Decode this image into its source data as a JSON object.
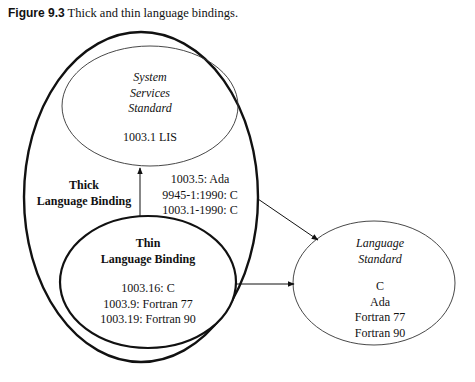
{
  "caption": {
    "label": "Figure 9.3",
    "text": " Thick and thin language bindings."
  },
  "nodes": {
    "system_services": {
      "title_lines": [
        "System",
        "Services",
        "Standard"
      ],
      "items": [
        "1003.1 LIS"
      ]
    },
    "thick_binding": {
      "title_lines": [
        "Thick",
        "Language Binding"
      ],
      "items": [
        "1003.5: Ada",
        "9945-1:1990: C",
        "1003.1-1990: C"
      ]
    },
    "thin_binding": {
      "title_lines": [
        "Thin",
        "Language Binding"
      ],
      "items": [
        "1003.16: C",
        "1003.9: Fortran 77",
        "1003.19: Fortran 90"
      ]
    },
    "language_standard": {
      "title_lines": [
        "Language",
        "Standard"
      ],
      "items": [
        "C",
        "Ada",
        "Fortran 77",
        "Fortran 90"
      ]
    }
  },
  "edges": [
    {
      "from": "thin_binding",
      "to": "system_services"
    },
    {
      "from": "thick_binding",
      "to": "language_standard"
    },
    {
      "from": "thin_binding",
      "to": "language_standard"
    }
  ]
}
